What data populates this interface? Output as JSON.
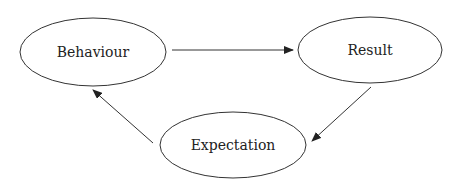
{
  "diagram": {
    "type": "cycle",
    "nodes": [
      {
        "id": "behaviour",
        "label": "Behaviour"
      },
      {
        "id": "result",
        "label": "Result"
      },
      {
        "id": "expectation",
        "label": "Expectation"
      }
    ],
    "edges": [
      {
        "from": "behaviour",
        "to": "result"
      },
      {
        "from": "result",
        "to": "expectation"
      },
      {
        "from": "expectation",
        "to": "behaviour"
      }
    ],
    "colors": {
      "stroke": "#333333",
      "text": "#222222",
      "background": "#ffffff"
    }
  }
}
